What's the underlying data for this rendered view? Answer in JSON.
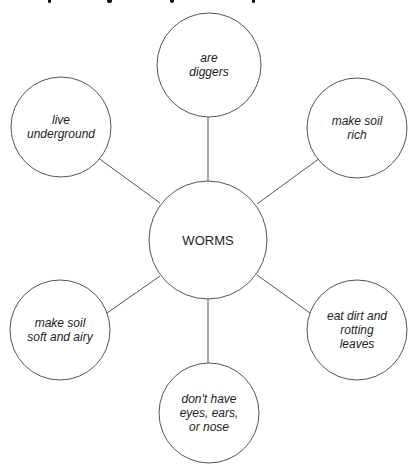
{
  "diagram": {
    "type": "web",
    "stroke_color": "#555555",
    "text_color": "#222222",
    "center": {
      "label": "WORMS",
      "cx": 208,
      "cy": 240,
      "r": 59
    },
    "nodes": [
      {
        "id": "top",
        "label": "are\ndiggers",
        "cx": 209,
        "cy": 65,
        "r": 52
      },
      {
        "id": "upper-left",
        "label": "live\nunderground",
        "cx": 61,
        "cy": 127,
        "r": 50
      },
      {
        "id": "upper-right",
        "label": "make soil\nrich",
        "cx": 357,
        "cy": 128,
        "r": 50
      },
      {
        "id": "lower-left",
        "label": "make soil\nsoft and airy",
        "cx": 60,
        "cy": 330,
        "r": 50
      },
      {
        "id": "lower-right",
        "label": "eat dirt and\nrotting\nleaves",
        "cx": 357,
        "cy": 330,
        "r": 50
      },
      {
        "id": "bottom",
        "label": "don't have\neyes, ears,\nor nose",
        "cx": 209,
        "cy": 413,
        "r": 50
      }
    ],
    "connectors": [
      {
        "to": "top",
        "x1": 208,
        "y1": 181,
        "x2": 208,
        "y2": 117
      },
      {
        "to": "upper-left",
        "x1": 160,
        "y1": 203,
        "x2": 97,
        "y2": 157
      },
      {
        "to": "upper-right",
        "x1": 257,
        "y1": 204,
        "x2": 320,
        "y2": 158
      },
      {
        "to": "lower-left",
        "x1": 160,
        "y1": 276,
        "x2": 107,
        "y2": 313
      },
      {
        "to": "lower-right",
        "x1": 257,
        "y1": 275,
        "x2": 310,
        "y2": 313
      },
      {
        "to": "bottom",
        "x1": 208,
        "y1": 299,
        "x2": 208,
        "y2": 363
      }
    ]
  }
}
